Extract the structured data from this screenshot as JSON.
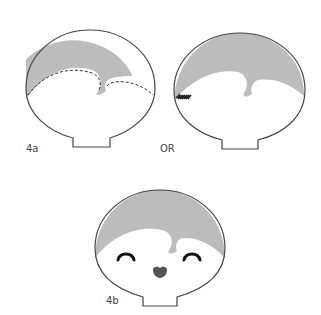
{
  "figures": [
    {
      "id": "4a",
      "label": "4a",
      "variant": "dashed-stitch hairline"
    },
    {
      "id": "4a-alt",
      "label": "OR",
      "variant": "zigzag stitch at side"
    },
    {
      "id": "4b",
      "label": "4b",
      "variant": "finished face with eyes and nose"
    }
  ],
  "colors": {
    "outline": "#444444",
    "hair": "#bcbcbc",
    "face": "#ffffff",
    "features": "#222222",
    "nose": "#555555"
  }
}
